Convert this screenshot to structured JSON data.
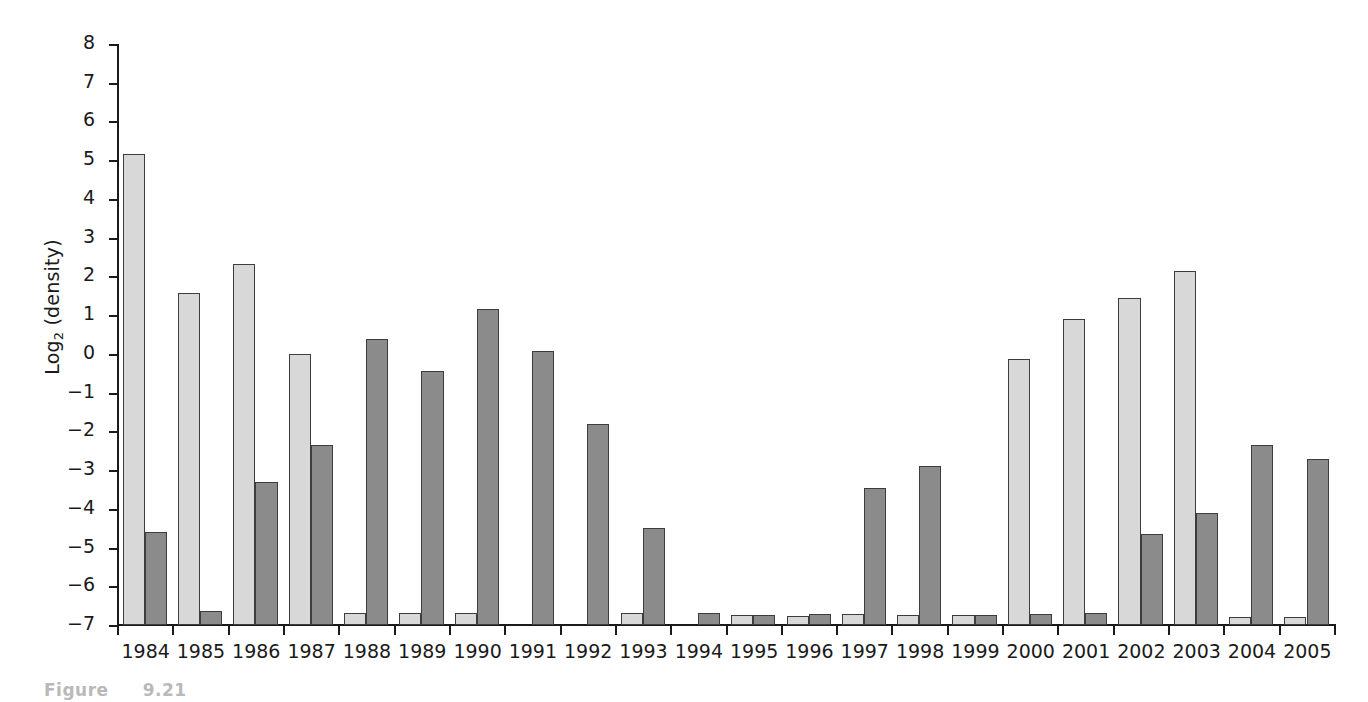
{
  "figure": {
    "caption_prefix": "Figure",
    "caption_number": "9.21"
  },
  "axes": {
    "ylabel_text": "Log",
    "ylabel_sub": "2",
    "ylabel_suffix": " (density)",
    "ylabel_full": "Log2 (density)",
    "xlabel": "",
    "y_ticks": [
      "8",
      "7",
      "6",
      "5",
      "4",
      "3",
      "2",
      "1",
      "0",
      "-1",
      "-2",
      "-3",
      "-4",
      "-5",
      "-6",
      "-7"
    ]
  },
  "colors": {
    "light_series": "#d8d8d8",
    "dark_series": "#8b8b8b",
    "bar_outline": "#3d3d3d",
    "axis": "#1a1a1a",
    "background": "#ffffff",
    "caption": "#b9b9b9"
  },
  "chart_data": {
    "type": "bar",
    "title": "",
    "xlabel": "",
    "ylabel": "Log2 (density)",
    "ylim": [
      -7,
      8
    ],
    "ytick_step": 1,
    "grid": false,
    "legend": "none",
    "baseline": -7,
    "categories": [
      "1984",
      "1985",
      "1986",
      "1987",
      "1988",
      "1989",
      "1990",
      "1991",
      "1992",
      "1993",
      "1994",
      "1995",
      "1996",
      "1997",
      "1998",
      "1999",
      "2000",
      "2001",
      "2002",
      "2003",
      "2004",
      "2005"
    ],
    "series": [
      {
        "name": "light",
        "color": "#d8d8d8",
        "values": [
          5.15,
          1.58,
          2.32,
          0.0,
          -6.7,
          -6.7,
          -6.7,
          null,
          null,
          -6.7,
          null,
          -6.75,
          -6.77,
          -6.72,
          -6.75,
          -6.75,
          -0.13,
          0.9,
          1.45,
          2.15,
          -6.8,
          -6.8
        ]
      },
      {
        "name": "dark",
        "color": "#8b8b8b",
        "values": [
          -4.6,
          -6.65,
          -3.3,
          -2.35,
          0.38,
          -0.45,
          1.15,
          0.07,
          -1.82,
          -4.5,
          -6.68,
          -6.73,
          -6.72,
          -3.45,
          -2.9,
          -6.75,
          -6.72,
          -6.7,
          -4.65,
          -4.1,
          -2.35,
          -2.72
        ]
      }
    ]
  }
}
